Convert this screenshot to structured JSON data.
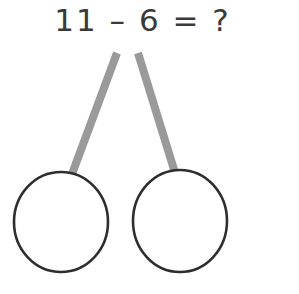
{
  "canvas": {
    "width": 299,
    "height": 294,
    "background": "#ffffff"
  },
  "equation": {
    "text": "11 – 6 = ?",
    "minuend": "11",
    "operator": "–",
    "subtrahend": "6",
    "equals": "=",
    "result": "?",
    "color": "#3a3a3a"
  },
  "diagram": {
    "type": "number-bond",
    "stroke_color": "#2e2e2e",
    "stem_color": "#9a9a9a",
    "stem_width": 8,
    "circle_stroke_width": 2.6,
    "stems": [
      {
        "name": "left-stem",
        "x1": 117,
        "y1": 53,
        "x2": 72,
        "y2": 174
      },
      {
        "name": "right-stem",
        "x1": 138,
        "y1": 53,
        "x2": 176,
        "y2": 176
      }
    ],
    "circles": [
      {
        "name": "left-circle",
        "cx": 61,
        "cy": 222,
        "rx": 47,
        "ry": 50,
        "fill": "none",
        "value": ""
      },
      {
        "name": "right-circle",
        "cx": 180,
        "cy": 221,
        "rx": 47,
        "ry": 51,
        "fill": "none",
        "value": ""
      }
    ]
  }
}
